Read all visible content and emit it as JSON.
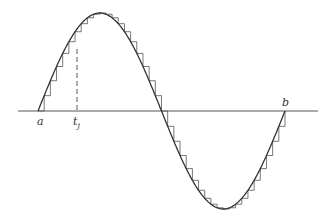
{
  "figure": {
    "colors": {
      "curve": "#333333",
      "axis": "#555555",
      "steps": "#555555",
      "background": "#ffffff"
    },
    "axis": {
      "y": 111,
      "x_start": 18,
      "x_end": 318
    },
    "curve": {
      "x_start": 38,
      "x_end": 285,
      "baseline_y": 111,
      "amplitude": 98,
      "periods": 1
    },
    "steps": {
      "count": 40
    },
    "dashed_line": {
      "x": 77,
      "y_top": 49,
      "y_bottom": 111
    },
    "labels": {
      "a": {
        "text": "a",
        "x": 37,
        "y": 116
      },
      "tj": {
        "text": "t",
        "sub": "j",
        "x": 73,
        "y": 116
      },
      "b": {
        "text": "b",
        "x": 282,
        "y": 97
      }
    }
  }
}
